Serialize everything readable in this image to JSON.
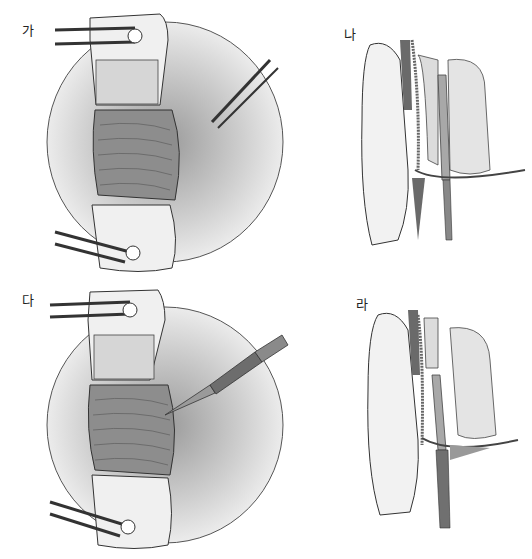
{
  "figure": {
    "panels": [
      {
        "label": "가",
        "view": "retractor-exposure-with-needle"
      },
      {
        "label": "나",
        "view": "sagittal-section-finger-guide"
      },
      {
        "label": "다",
        "view": "retractor-exposure-with-knife"
      },
      {
        "label": "라",
        "view": "sagittal-section-incision"
      }
    ],
    "colors": {
      "line": "#2a2a2a",
      "tissue_light": "#e8e8e8",
      "tissue_mid": "#bdbdbd",
      "tissue_dark": "#6a6a6a",
      "background": "#ffffff"
    }
  }
}
